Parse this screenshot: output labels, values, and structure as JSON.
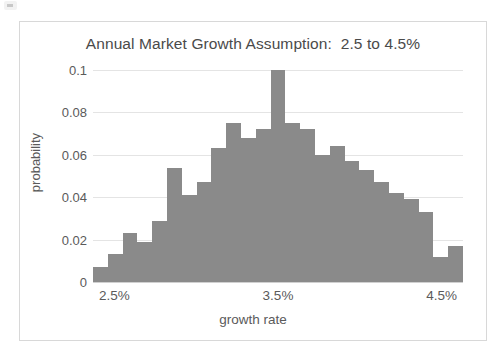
{
  "chart_data": {
    "type": "bar",
    "title": "Annual Market Growth Assumption:  2.5 to 4.5%",
    "xlabel": "growth rate",
    "ylabel": "probability",
    "xlim": [
      2.5,
      4.5
    ],
    "ylim": [
      0,
      0.1
    ],
    "grid": true,
    "legend": null,
    "bar_color": "#8a8a8a",
    "y_ticks": [
      0.1,
      0.08,
      0.06,
      0.04,
      0.02,
      0
    ],
    "y_tick_labels": [
      "0.1",
      "0.08",
      "0.06",
      "0.04",
      "0.02",
      "0"
    ],
    "x_ticks": [
      2.5,
      3.5,
      4.5
    ],
    "x_tick_labels": [
      "2.5%",
      "3.5%",
      "4.5%"
    ],
    "categories": [
      "2.50",
      "2.58",
      "2.66",
      "2.74",
      "2.82",
      "2.90",
      "2.98",
      "3.06",
      "3.14",
      "3.22",
      "3.30",
      "3.38",
      "3.46",
      "3.54",
      "3.62",
      "3.70",
      "3.78",
      "3.86",
      "3.94",
      "4.02",
      "4.10",
      "4.18",
      "4.26",
      "4.34",
      "4.42"
    ],
    "values": [
      0.007,
      0.013,
      0.023,
      0.019,
      0.029,
      0.054,
      0.041,
      0.047,
      0.063,
      0.075,
      0.068,
      0.072,
      0.1,
      0.075,
      0.072,
      0.06,
      0.064,
      0.057,
      0.053,
      0.047,
      0.042,
      0.039,
      0.033,
      0.012,
      0.017
    ]
  }
}
